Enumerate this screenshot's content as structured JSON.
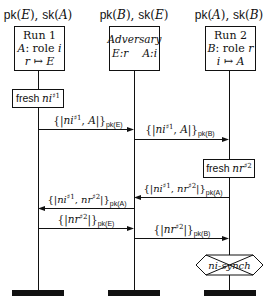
{
  "diagram": {
    "type": "message-sequence-chart",
    "colors": {
      "line": "#111111",
      "background": "#ffffff"
    },
    "lifelines": [
      {
        "id": "run1",
        "x": 38,
        "keys": {
          "pk": "pk",
          "pk_arg": "E",
          "sk": "sk",
          "sk_arg": "A"
        },
        "box": {
          "title": "Run 1",
          "line2_agent": "A",
          "line2_text": ": role ",
          "line2_role": "i",
          "line3_from": "r",
          "line3_arrow": "↦",
          "line3_to": "E"
        }
      },
      {
        "id": "adversary",
        "x": 134,
        "keys": {
          "pk": "pk",
          "pk_arg": "B",
          "sk": "sk",
          "sk_arg": "E"
        },
        "box": {
          "title": "Adversary",
          "left": "E:r",
          "right": "A:i"
        }
      },
      {
        "id": "run2",
        "x": 229,
        "keys": {
          "pk": "pk",
          "pk_arg": "A",
          "sk": "sk",
          "sk_arg": "B"
        },
        "box": {
          "title": "Run 2",
          "line2_agent": "B",
          "line2_text": ": role ",
          "line2_role": "r",
          "line3_from": "i",
          "line3_arrow": "↦",
          "line3_to": "A"
        }
      }
    ],
    "actions": [
      {
        "type": "fresh",
        "lifeline": "run1",
        "label": "fresh",
        "nonce": "ni",
        "sup": "#1"
      },
      {
        "type": "fresh",
        "lifeline": "run2",
        "label": "fresh",
        "nonce": "nr",
        "sup": "#2"
      }
    ],
    "messages": [
      {
        "from": "run1",
        "to": "adversary",
        "content": "{|ni#1, A|}",
        "key": "pk(E)",
        "y": 127
      },
      {
        "from": "adversary",
        "to": "run2",
        "content": "{|ni#1, A|}",
        "key": "pk(B)",
        "y": 137
      },
      {
        "from": "run2",
        "to": "adversary",
        "content": "{|ni#1, nr#2|}",
        "key": "pk(A)",
        "y": 196
      },
      {
        "from": "adversary",
        "to": "run1",
        "content": "{|ni#1, nr#2|}",
        "key": "pk(A)",
        "y": 208
      },
      {
        "from": "run1",
        "to": "adversary",
        "content": "{|nr#2|}",
        "key": "pk(E)",
        "y": 228
      },
      {
        "from": "adversary",
        "to": "run2",
        "content": "{|nr#2|}",
        "key": "pk(B)",
        "y": 238
      }
    ],
    "claim": {
      "lifeline": "run2",
      "label": "ni-synch",
      "status": "crossed-out"
    },
    "labels": {
      "m_ni": "ni",
      "m_nr": "nr",
      "sup1": "♯1",
      "sup2": "♯2",
      "A": "A",
      "pkE": "pk(E)",
      "pkB": "pk(B)",
      "pkA": "pk(A)",
      "comma": ", ",
      "lbr": "{|",
      "rbr": "|}"
    }
  }
}
